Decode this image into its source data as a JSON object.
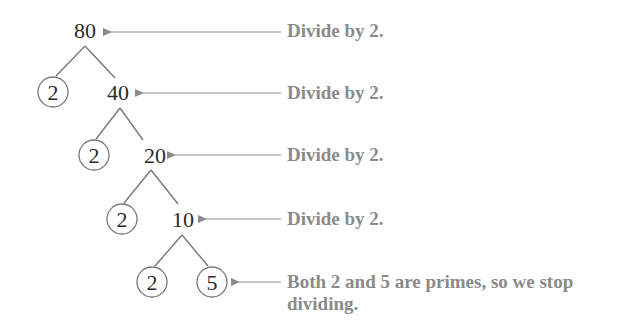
{
  "diagram": {
    "type": "factor-tree",
    "root": "80",
    "rows": [
      {
        "composite": "80",
        "prime": null,
        "note": "Divide by 2."
      },
      {
        "composite": "40",
        "prime": "2",
        "note": "Divide by 2."
      },
      {
        "composite": "20",
        "prime": "2",
        "note": "Divide by 2."
      },
      {
        "composite": "10",
        "prime": "2",
        "note": "Divide by 2."
      },
      {
        "composite": null,
        "primes": [
          "2",
          "5"
        ],
        "note": "Both 2 and 5 are primes, so we stop dividing."
      }
    ],
    "leaves": [
      "2",
      "2",
      "2",
      "2",
      "5"
    ],
    "colors": {
      "numbers": "#2b2b2b",
      "lines": "#777777",
      "annotations": "#8a8a8a",
      "arrows": "#8a8a8a"
    }
  }
}
